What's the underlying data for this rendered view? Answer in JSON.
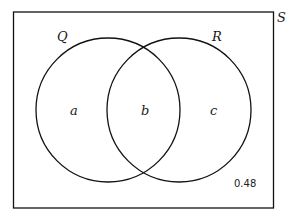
{
  "diagram": {
    "type": "venn",
    "universe_label": "S",
    "sets": [
      {
        "label": "Q",
        "region_label": "a"
      },
      {
        "label": "R",
        "region_label": "c"
      }
    ],
    "intersection_label": "b",
    "outside_value": "0.48"
  },
  "colors": {
    "stroke": "#111111",
    "background": "#ffffff"
  }
}
